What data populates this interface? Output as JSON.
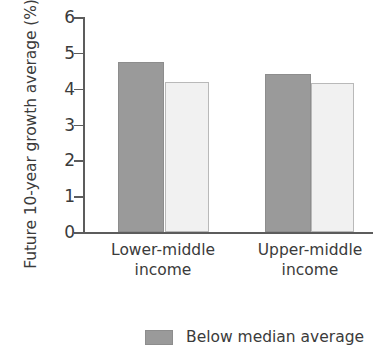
{
  "chart_data": {
    "type": "bar",
    "title": "",
    "subtitle": "",
    "xlabel": "",
    "ylabel": "Future 10-year growth average (%)",
    "categories": [
      "Lower-middle income",
      "Upper-middle income"
    ],
    "category_lines": [
      [
        "Lower-middle",
        "income"
      ],
      [
        "Upper-middle",
        "income"
      ]
    ],
    "series": [
      {
        "name": "Below median average",
        "values": [
          4.75,
          4.4
        ],
        "color": "#9a9a9a"
      },
      {
        "name": "",
        "values": [
          4.2,
          4.15
        ],
        "color": "#f1f1f1"
      }
    ],
    "ylim": [
      0,
      6
    ],
    "yticks": [
      0,
      1,
      2,
      3,
      4,
      5,
      6
    ],
    "ytick_labels": [
      "0",
      "1",
      "2",
      "3",
      "4",
      "5",
      "6"
    ],
    "grid": false,
    "legend_position": "bottom",
    "legend": [
      {
        "label": "Below median average",
        "color": "#9a9a9a"
      }
    ]
  },
  "axis": {
    "y_title": "Future 10-year growth average (%)",
    "tick_0": "0",
    "tick_1": "1",
    "tick_2": "2",
    "tick_3": "3",
    "tick_4": "4",
    "tick_5": "5",
    "tick_6": "6"
  },
  "categories": {
    "cat1_line1": "Lower-middle",
    "cat1_line2": "income",
    "cat2_line1": "Upper-middle",
    "cat2_line2": "income"
  },
  "legend": {
    "item1_label": "Below median average"
  }
}
